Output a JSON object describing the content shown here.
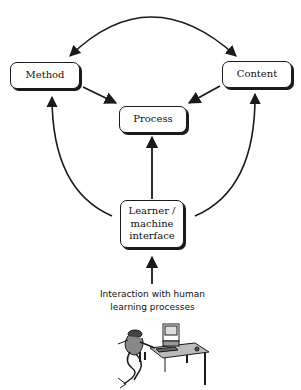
{
  "diagram": {
    "nodes": {
      "method": {
        "label": "Method"
      },
      "content": {
        "label": "Content"
      },
      "process": {
        "label": "Process"
      },
      "learner": {
        "lines": [
          "Learner /",
          "machine",
          "interface"
        ]
      }
    },
    "caption": {
      "line1": "Interaction with human",
      "line2": "learning processes"
    },
    "edges": [
      {
        "from": "method",
        "to": "content",
        "type": "bidirectional-arc"
      },
      {
        "from": "method",
        "to": "process",
        "type": "arrow"
      },
      {
        "from": "content",
        "to": "process",
        "type": "arrow"
      },
      {
        "from": "learner",
        "to": "process",
        "type": "arrow"
      },
      {
        "from": "learner",
        "to": "method",
        "type": "arc-arrow"
      },
      {
        "from": "learner",
        "to": "content",
        "type": "arc-arrow"
      },
      {
        "from": "human-learning",
        "to": "learner",
        "type": "arrow"
      }
    ],
    "illustration": "person-at-computer-desk",
    "stroke_color": "#1a1a1a"
  }
}
